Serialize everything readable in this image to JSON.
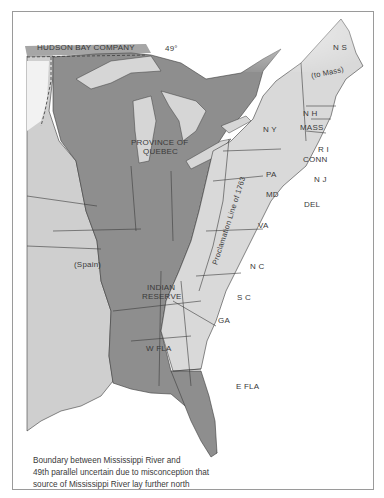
{
  "map": {
    "colors": {
      "background": "#ffffff",
      "frame_border": "#9a9a9a",
      "british_territory_dark": "#8e8e8e",
      "colonies_light": "#d9d9d9",
      "spanish_territory": "#cfcfcf",
      "borders": "#3c3c3c",
      "water_lakes": "#d6d6d6"
    },
    "labels": {
      "hudson_bay_company": "HUDSON BAY COMPANY",
      "parallel_49": "49°",
      "nova_scotia": "N S",
      "to_mass": "(to Mass)",
      "new_hampshire": "N H",
      "massachusetts": "MASS",
      "new_york": "N Y",
      "rhode_island": "R I",
      "connecticut": "CONN",
      "province_of_quebec_line1": "PROVINCE OF",
      "province_of_quebec_line2": "QUEBEC",
      "pennsylvania": "PA",
      "new_jersey": "N J",
      "maryland": "MD",
      "delaware": "DEL",
      "proclamation_line": "Proclamation Line of 1763",
      "virginia": "VA",
      "spain": "(Spain)",
      "north_carolina": "N C",
      "indian_reserve_line1": "INDIAN",
      "indian_reserve_line2": "RESERVE",
      "south_carolina": "S C",
      "georgia": "GA",
      "west_florida": "W FLA",
      "east_florida": "E FLA"
    },
    "note": {
      "line1": "Boundary between Mississippi River and",
      "line2": "49th parallel uncertain due to misconception that",
      "line3": "source of Mississippi River lay further north"
    }
  }
}
